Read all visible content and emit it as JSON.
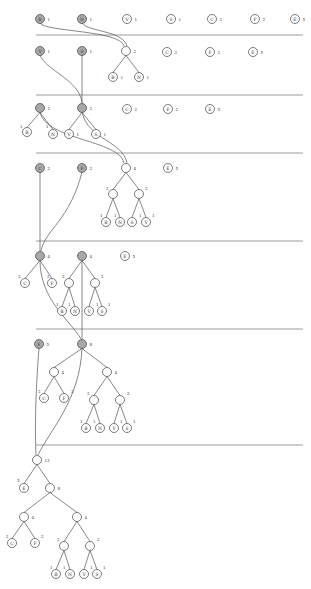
{
  "colors": {
    "active_node": "#a8a8a8",
    "node": "#ffffff",
    "separator": "#9a9a9a"
  },
  "separators_y": [
    35,
    95,
    153,
    241,
    329,
    445
  ],
  "stages": [
    {
      "id": 1,
      "nodes": [
        {
          "id": "s1B",
          "letter": "B",
          "weight": "1",
          "x": 40,
          "y": 19,
          "active": true
        },
        {
          "id": "s1N",
          "letter": "N",
          "weight": "1",
          "x": 82,
          "y": 19,
          "active": true
        },
        {
          "id": "s1V",
          "letter": "V",
          "weight": "1",
          "x": 127,
          "y": 19
        },
        {
          "id": "s1S",
          "letter": "S",
          "weight": "1",
          "x": 171,
          "y": 19
        },
        {
          "id": "s1C",
          "letter": "C",
          "weight": "2",
          "x": 212,
          "y": 19
        },
        {
          "id": "s1F",
          "letter": "F",
          "weight": "2",
          "x": 255,
          "y": 19
        },
        {
          "id": "s1E",
          "letter": "E",
          "weight": "5",
          "x": 295,
          "y": 19
        }
      ]
    },
    {
      "id": 2,
      "nodes": [
        {
          "id": "s2V",
          "letter": "V",
          "weight": "1",
          "x": 40,
          "y": 51,
          "active": true
        },
        {
          "id": "s2S",
          "letter": "S",
          "weight": "1",
          "x": 82,
          "y": 51,
          "active": true
        },
        {
          "id": "s2r",
          "letter": "",
          "weight": "2",
          "x": 126,
          "y": 51
        },
        {
          "id": "s2B",
          "letter": "B",
          "weight": "1",
          "x": 113,
          "y": 77
        },
        {
          "id": "s2N",
          "letter": "N",
          "weight": "1",
          "x": 139,
          "y": 77
        },
        {
          "id": "s2C",
          "letter": "C",
          "weight": "2",
          "x": 167,
          "y": 52
        },
        {
          "id": "s2F",
          "letter": "F",
          "weight": "2",
          "x": 210,
          "y": 52
        },
        {
          "id": "s2E",
          "letter": "E",
          "weight": "5",
          "x": 253,
          "y": 52
        }
      ],
      "edges": [
        [
          "s2r",
          "s2B"
        ],
        [
          "s2r",
          "s2N"
        ]
      ]
    },
    {
      "id": 3,
      "nodes": [
        {
          "id": "s3a",
          "letter": "",
          "weight": "2",
          "x": 40,
          "y": 108,
          "active": true
        },
        {
          "id": "s3B",
          "letter": "B",
          "weight": "",
          "x": 27,
          "y": 132
        },
        {
          "id": "s3N",
          "letter": "N",
          "weight": "",
          "x": 53,
          "y": 134
        },
        {
          "id": "s3b",
          "letter": "",
          "weight": "2",
          "x": 82,
          "y": 108,
          "active": true
        },
        {
          "id": "s3V",
          "letter": "V",
          "weight": "1",
          "x": 69,
          "y": 134
        },
        {
          "id": "s3S",
          "letter": "S",
          "weight": "1",
          "x": 96,
          "y": 134
        },
        {
          "id": "s3C",
          "letter": "C",
          "weight": "2",
          "x": 127,
          "y": 109
        },
        {
          "id": "s3F",
          "letter": "F",
          "weight": "2",
          "x": 168,
          "y": 109
        },
        {
          "id": "s3E",
          "letter": "E",
          "weight": "5",
          "x": 210,
          "y": 109
        }
      ],
      "edges": [
        [
          "s3a",
          "s3B"
        ],
        [
          "s3a",
          "s3N"
        ],
        [
          "s3b",
          "s3V"
        ],
        [
          "s3b",
          "s3S"
        ]
      ],
      "edge_weights": [
        {
          "x": 20,
          "y": 128,
          "t": "1"
        },
        {
          "x": 46,
          "y": 128,
          "t": "1"
        }
      ]
    },
    {
      "id": 4,
      "nodes": [
        {
          "id": "s4C",
          "letter": "C",
          "weight": "2",
          "x": 40,
          "y": 168,
          "active": true
        },
        {
          "id": "s4F",
          "letter": "F",
          "weight": "2",
          "x": 82,
          "y": 168,
          "active": true
        },
        {
          "id": "s4r",
          "letter": "",
          "weight": "4",
          "x": 126,
          "y": 168
        },
        {
          "id": "s4a",
          "letter": "",
          "weight": "",
          "x": 113,
          "y": 194
        },
        {
          "id": "s4b",
          "letter": "",
          "weight": "",
          "x": 139,
          "y": 194
        },
        {
          "id": "s4B",
          "letter": "B",
          "weight": "",
          "x": 106,
          "y": 222
        },
        {
          "id": "s4N",
          "letter": "N",
          "weight": "",
          "x": 120,
          "y": 222
        },
        {
          "id": "s4S",
          "letter": "S",
          "weight": "",
          "x": 132,
          "y": 222
        },
        {
          "id": "s4V",
          "letter": "V",
          "weight": "",
          "x": 146,
          "y": 222
        },
        {
          "id": "s4E",
          "letter": "E",
          "weight": "5",
          "x": 168,
          "y": 168
        }
      ],
      "edges": [
        [
          "s4r",
          "s4a"
        ],
        [
          "s4r",
          "s4b"
        ],
        [
          "s4a",
          "s4B"
        ],
        [
          "s4a",
          "s4N"
        ],
        [
          "s4b",
          "s4S"
        ],
        [
          "s4b",
          "s4V"
        ]
      ],
      "edge_weights": [
        {
          "x": 106,
          "y": 190,
          "t": "2"
        },
        {
          "x": 145,
          "y": 190,
          "t": "2"
        },
        {
          "x": 100,
          "y": 217,
          "t": "1"
        },
        {
          "x": 114,
          "y": 217,
          "t": "1"
        },
        {
          "x": 139,
          "y": 217,
          "t": "1"
        },
        {
          "x": 152,
          "y": 217,
          "t": "1"
        }
      ]
    },
    {
      "id": 5,
      "nodes": [
        {
          "id": "s5a",
          "letter": "",
          "weight": "4",
          "x": 40,
          "y": 256,
          "active": true
        },
        {
          "id": "s5C",
          "letter": "C",
          "weight": "",
          "x": 25,
          "y": 283
        },
        {
          "id": "s5F",
          "letter": "F",
          "weight": "",
          "x": 52,
          "y": 283
        },
        {
          "id": "s5b",
          "letter": "",
          "weight": "4",
          "x": 82,
          "y": 256,
          "active": true
        },
        {
          "id": "s5c",
          "letter": "",
          "weight": "",
          "x": 69,
          "y": 283
        },
        {
          "id": "s5d",
          "letter": "",
          "weight": "",
          "x": 95,
          "y": 283
        },
        {
          "id": "s5B",
          "letter": "B",
          "weight": "",
          "x": 62,
          "y": 311
        },
        {
          "id": "s5N",
          "letter": "N",
          "weight": "",
          "x": 75,
          "y": 311
        },
        {
          "id": "s5V",
          "letter": "V",
          "weight": "",
          "x": 89,
          "y": 311
        },
        {
          "id": "s5S",
          "letter": "S",
          "weight": "",
          "x": 102,
          "y": 311
        },
        {
          "id": "s5E",
          "letter": "E",
          "weight": "5",
          "x": 125,
          "y": 256
        }
      ],
      "edges": [
        [
          "s5a",
          "s5C"
        ],
        [
          "s5a",
          "s5F"
        ],
        [
          "s5b",
          "s5c"
        ],
        [
          "s5b",
          "s5d"
        ],
        [
          "s5c",
          "s5B"
        ],
        [
          "s5c",
          "s5N"
        ],
        [
          "s5d",
          "s5V"
        ],
        [
          "s5d",
          "s5S"
        ]
      ],
      "edge_weights": [
        {
          "x": 18,
          "y": 278,
          "t": "2"
        },
        {
          "x": 47,
          "y": 278,
          "t": "2"
        },
        {
          "x": 62,
          "y": 278,
          "t": "2"
        },
        {
          "x": 101,
          "y": 278,
          "t": "2"
        },
        {
          "x": 56,
          "y": 306,
          "t": "1"
        },
        {
          "x": 68,
          "y": 306,
          "t": "1"
        },
        {
          "x": 96,
          "y": 306,
          "t": "1"
        },
        {
          "x": 108,
          "y": 306,
          "t": "1"
        }
      ]
    },
    {
      "id": 6,
      "nodes": [
        {
          "id": "s6E",
          "letter": "E",
          "weight": "5",
          "x": 39,
          "y": 344,
          "active": true
        },
        {
          "id": "s6r",
          "letter": "",
          "weight": "8",
          "x": 82,
          "y": 344,
          "active": true
        },
        {
          "id": "s6a",
          "letter": "",
          "weight": "4",
          "x": 54,
          "y": 372
        },
        {
          "id": "s6C",
          "letter": "C",
          "weight": "",
          "x": 44,
          "y": 398
        },
        {
          "id": "s6F",
          "letter": "F",
          "weight": "",
          "x": 64,
          "y": 398
        },
        {
          "id": "s6b",
          "letter": "",
          "weight": "4",
          "x": 107,
          "y": 372
        },
        {
          "id": "s6c",
          "letter": "",
          "weight": "",
          "x": 94,
          "y": 400
        },
        {
          "id": "s6d",
          "letter": "",
          "weight": "",
          "x": 120,
          "y": 400
        },
        {
          "id": "s6B",
          "letter": "B",
          "weight": "",
          "x": 86,
          "y": 428
        },
        {
          "id": "s6N",
          "letter": "N",
          "weight": "",
          "x": 100,
          "y": 428
        },
        {
          "id": "s6V",
          "letter": "V",
          "weight": "",
          "x": 114,
          "y": 428
        },
        {
          "id": "s6S",
          "letter": "S",
          "weight": "",
          "x": 127,
          "y": 428
        }
      ],
      "edges": [
        [
          "s6r",
          "s6a"
        ],
        [
          "s6r",
          "s6b"
        ],
        [
          "s6a",
          "s6C"
        ],
        [
          "s6a",
          "s6F"
        ],
        [
          "s6b",
          "s6c"
        ],
        [
          "s6b",
          "s6d"
        ],
        [
          "s6c",
          "s6B"
        ],
        [
          "s6c",
          "s6N"
        ],
        [
          "s6d",
          "s6V"
        ],
        [
          "s6d",
          "s6S"
        ]
      ],
      "edge_weights": [
        {
          "x": 38,
          "y": 393,
          "t": "2"
        },
        {
          "x": 71,
          "y": 393,
          "t": "2"
        },
        {
          "x": 87,
          "y": 395,
          "t": "2"
        },
        {
          "x": 127,
          "y": 395,
          "t": "2"
        },
        {
          "x": 80,
          "y": 423,
          "t": "1"
        },
        {
          "x": 93,
          "y": 423,
          "t": "1"
        },
        {
          "x": 120,
          "y": 423,
          "t": "1"
        },
        {
          "x": 133,
          "y": 423,
          "t": "1"
        }
      ]
    },
    {
      "id": 7,
      "nodes": [
        {
          "id": "s7r",
          "letter": "",
          "weight": "13",
          "x": 37,
          "y": 460
        },
        {
          "id": "s7E",
          "letter": "E",
          "weight": "",
          "x": 24,
          "y": 488
        },
        {
          "id": "s7a",
          "letter": "",
          "weight": "8",
          "x": 50,
          "y": 488
        },
        {
          "id": "s7b",
          "letter": "",
          "weight": "4",
          "x": 24,
          "y": 517
        },
        {
          "id": "s7C",
          "letter": "C",
          "weight": "",
          "x": 12,
          "y": 543
        },
        {
          "id": "s7F",
          "letter": "F",
          "weight": "",
          "x": 35,
          "y": 543
        },
        {
          "id": "s7c",
          "letter": "",
          "weight": "4",
          "x": 77,
          "y": 517
        },
        {
          "id": "s7d",
          "letter": "",
          "weight": "",
          "x": 64,
          "y": 546
        },
        {
          "id": "s7e",
          "letter": "",
          "weight": "",
          "x": 90,
          "y": 546
        },
        {
          "id": "s7B",
          "letter": "B",
          "weight": "",
          "x": 56,
          "y": 574
        },
        {
          "id": "s7N",
          "letter": "N",
          "weight": "",
          "x": 70,
          "y": 574
        },
        {
          "id": "s7V",
          "letter": "V",
          "weight": "",
          "x": 84,
          "y": 574
        },
        {
          "id": "s7S",
          "letter": "S",
          "weight": "",
          "x": 97,
          "y": 574
        }
      ],
      "edges": [
        [
          "s7r",
          "s7E"
        ],
        [
          "s7r",
          "s7a"
        ],
        [
          "s7a",
          "s7b"
        ],
        [
          "s7a",
          "s7c"
        ],
        [
          "s7b",
          "s7C"
        ],
        [
          "s7b",
          "s7F"
        ],
        [
          "s7c",
          "s7d"
        ],
        [
          "s7c",
          "s7e"
        ],
        [
          "s7d",
          "s7B"
        ],
        [
          "s7d",
          "s7N"
        ],
        [
          "s7e",
          "s7V"
        ],
        [
          "s7e",
          "s7S"
        ]
      ],
      "edge_weights": [
        {
          "x": 17,
          "y": 482,
          "t": "5"
        },
        {
          "x": 6,
          "y": 538,
          "t": "2"
        },
        {
          "x": 41,
          "y": 538,
          "t": "2"
        },
        {
          "x": 57,
          "y": 541,
          "t": "2"
        },
        {
          "x": 97,
          "y": 541,
          "t": "2"
        },
        {
          "x": 50,
          "y": 569,
          "t": "1"
        },
        {
          "x": 63,
          "y": 569,
          "t": "1"
        },
        {
          "x": 90,
          "y": 569,
          "t": "1"
        },
        {
          "x": 103,
          "y": 569,
          "t": "1"
        }
      ]
    }
  ],
  "transitions": [
    {
      "d": "M40,23 C45,32 120,30 124,46"
    },
    {
      "d": "M82,23 C88,32 122,30 127,46"
    },
    {
      "d": "M40,55 C45,70 80,80 82,103"
    },
    {
      "d": "M82,55 C82,75 82,90 82,103"
    },
    {
      "d": "M126,55 C126,55 126,55 126,55"
    },
    {
      "d": "M40,112 C45,140 120,140 124,163"
    },
    {
      "d": "M82,112 C88,140 122,140 127,163"
    },
    {
      "d": "M40,172 L40,251"
    },
    {
      "d": "M82,172 C70,220 45,230 41,251"
    },
    {
      "d": "M126,172 C126,172 126,172 126,172"
    },
    {
      "d": "M40,260 C40,300 70,320 81,339"
    },
    {
      "d": "M82,260 L82,339"
    },
    {
      "d": "M39,348 C35,400 35,430 36,455"
    },
    {
      "d": "M82,348 C80,400 50,430 38,455"
    }
  ]
}
